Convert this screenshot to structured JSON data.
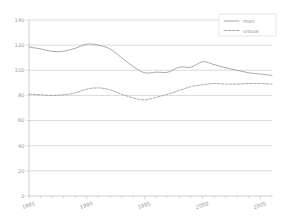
{
  "chart_data": {
    "type": "line",
    "title": "",
    "subtitle": "",
    "xlabel": "",
    "ylabel": "",
    "xlim": [
      1985,
      2006
    ],
    "ylim": [
      0,
      140
    ],
    "grid": true,
    "grid_axis": "y",
    "legend_position": "top-right",
    "x": [
      1985,
      1986,
      1987,
      1988,
      1989,
      1990,
      1991,
      1992,
      1993,
      1994,
      1995,
      1996,
      1997,
      1998,
      1999,
      2000,
      2001,
      2002,
      2003,
      2004,
      2005,
      2006
    ],
    "xticks": [
      1985,
      1990,
      1995,
      2000,
      2005
    ],
    "xtick_labels": [
      "1985",
      "1990",
      "1995",
      "2000",
      "2005"
    ],
    "yticks": [
      0,
      20,
      40,
      60,
      80,
      100,
      120,
      140
    ],
    "ytick_labels": [
      "0",
      "20",
      "40",
      "60",
      "80",
      "100",
      "120",
      "140"
    ],
    "series": [
      {
        "name": "man",
        "linestyle": "solid",
        "color": "#8c8c8c",
        "values": [
          118.5,
          117.0,
          115.0,
          115.2,
          117.5,
          120.8,
          120.0,
          117.0,
          110.0,
          103.0,
          98.0,
          98.5,
          98.5,
          102.5,
          102.5,
          106.8,
          104.5,
          102.0,
          100.0,
          98.0,
          97.0,
          96.0
        ]
      },
      {
        "name": "vrouw",
        "linestyle": "dashed",
        "color": "#8c8c8c",
        "values": [
          81.0,
          80.5,
          80.0,
          80.5,
          82.0,
          85.0,
          86.0,
          84.5,
          81.0,
          78.0,
          76.5,
          78.5,
          81.0,
          84.0,
          87.0,
          88.5,
          89.5,
          89.0,
          89.0,
          89.5,
          89.5,
          89.0
        ]
      }
    ]
  },
  "legend": {
    "entries": [
      {
        "label": "man",
        "style": "solid"
      },
      {
        "label": "vrouw",
        "style": "dashed"
      }
    ]
  },
  "colors": {
    "line": "#8c8c8c",
    "grid": "#b6b6b6",
    "axis": "#b0b0b0",
    "text": "#9a9a9a",
    "background": "#ffffff"
  }
}
